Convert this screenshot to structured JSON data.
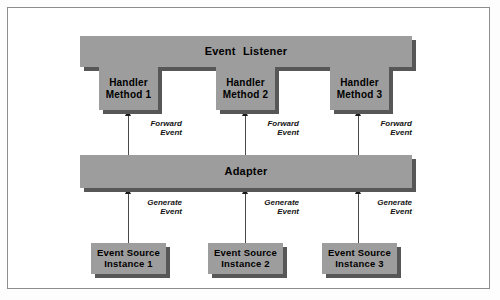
{
  "diagram": {
    "colors": {
      "block_fill": "#9d9d9d",
      "block_shadow": "#575757",
      "frame_border": "#8e8e8e",
      "connector": "#4a4a4a",
      "text": "#000000",
      "background": "#ffffff"
    },
    "listener": {
      "label": "Event Listener",
      "handlers": [
        {
          "line1": "Handler",
          "line2": "Method 1"
        },
        {
          "line1": "Handler",
          "line2": "Method 2"
        },
        {
          "line1": "Handler",
          "line2": "Method 3"
        }
      ]
    },
    "adapter": {
      "label": "Adapter"
    },
    "sources": [
      {
        "line1": "Event Source",
        "line2": "Instance 1"
      },
      {
        "line1": "Event Source",
        "line2": "Instance 2"
      },
      {
        "line1": "Event Source",
        "line2": "Instance 3"
      }
    ],
    "connectors": {
      "forward": [
        {
          "line1": "Forward",
          "line2": "Event"
        },
        {
          "line1": "Forward",
          "line2": "Event"
        },
        {
          "line1": "Forward",
          "line2": "Event"
        }
      ],
      "generate": [
        {
          "line1": "Generate",
          "line2": "Event"
        },
        {
          "line1": "Generate",
          "line2": "Event"
        },
        {
          "line1": "Generate",
          "line2": "Event"
        }
      ]
    }
  }
}
